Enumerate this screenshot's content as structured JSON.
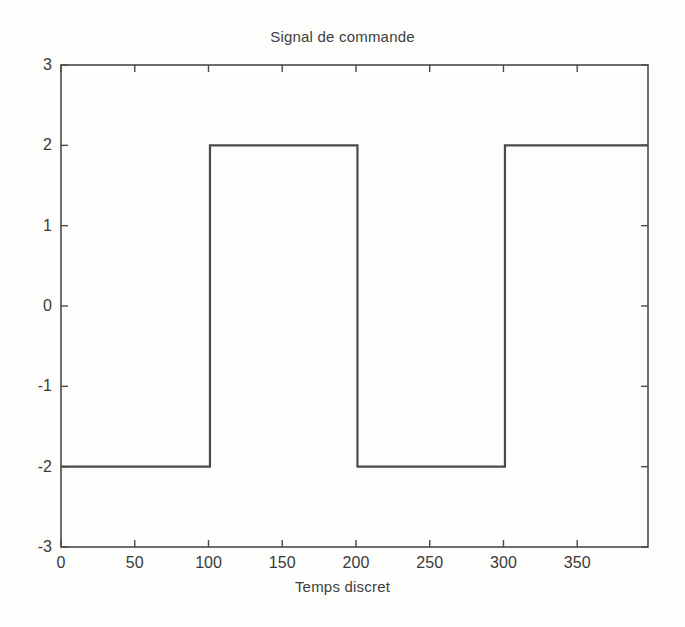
{
  "figure": {
    "background_color": "#fdfdfc",
    "line_color": "#4a4a4a",
    "axis_color": "#4a4a4a"
  },
  "chart_data": {
    "type": "line",
    "title": "Signal de commande",
    "xlabel": "Temps discret",
    "ylabel": "",
    "xlim": [
      0,
      398
    ],
    "ylim": [
      -3,
      3
    ],
    "xticks": [
      0,
      50,
      100,
      150,
      200,
      250,
      300,
      350
    ],
    "yticks": [
      -3,
      -2,
      -1,
      0,
      1,
      2,
      3
    ],
    "xtick_labels": [
      "0",
      "50",
      "100",
      "150",
      "200",
      "250",
      "300",
      "350"
    ],
    "ytick_labels": [
      "-3",
      "-2",
      "-1",
      "0",
      "1",
      "2",
      "3"
    ],
    "grid": false,
    "legend": null,
    "series": [
      {
        "name": "u(k)",
        "description": "Square wave, amplitude +/- 2, period 200 samples",
        "x": [
          0,
          101,
          101,
          201,
          201,
          301,
          301,
          398
        ],
        "y": [
          -2,
          -2,
          2,
          2,
          -2,
          -2,
          2,
          2
        ]
      }
    ],
    "annotations": []
  }
}
